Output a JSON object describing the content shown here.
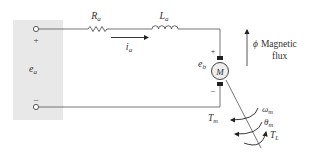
{
  "diagram": {
    "source": {
      "label": "e",
      "label_sub": "a",
      "plus": "+",
      "minus": "–",
      "box_color": "#e8e8e8"
    },
    "resistor": {
      "label": "R",
      "label_sub": "a"
    },
    "inductor": {
      "label": "L",
      "label_sub": "a"
    },
    "current": {
      "label": "i",
      "label_sub": "a"
    },
    "motor": {
      "label": "M",
      "back_emf_label": "e",
      "back_emf_sub": "b",
      "plus": "+",
      "minus": "–"
    },
    "flux": {
      "symbol": "ϕ",
      "text_line1": "Magnetic",
      "text_line2": "flux"
    },
    "mechanical": {
      "omega_label": "ω",
      "omega_sub": "m",
      "theta_label": "θ",
      "theta_sub": "m",
      "tm_label": "T",
      "tm_sub": "m",
      "tl_label": "T",
      "tl_sub": "L"
    },
    "colors": {
      "wire": "#555555",
      "text": "#333333",
      "terminal": "#555555"
    }
  }
}
